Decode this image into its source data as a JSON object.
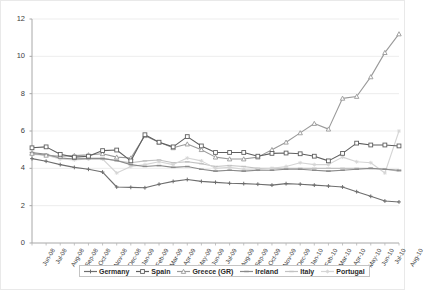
{
  "chart_data": {
    "type": "line",
    "title": "",
    "xlabel": "",
    "ylabel": "",
    "ylim": [
      0,
      12
    ],
    "yticks": [
      0,
      2,
      4,
      6,
      8,
      10,
      12
    ],
    "grid": true,
    "legend_position": "bottom",
    "categories": [
      "Jun-08",
      "Jul-08",
      "Aug-08",
      "Sep-08",
      "Oct-08",
      "Nov-08",
      "Dec-08",
      "Jan-09",
      "Feb-09",
      "Mar-09",
      "Apr-09",
      "May-09",
      "Jun-09",
      "Jul-09",
      "Aug-09",
      "Sep-09",
      "Oct-09",
      "Nov-09",
      "Dec-09",
      "Jan-10",
      "Feb-10",
      "Mar-10",
      "Apr-10",
      "May-10",
      "Jun-10",
      "Jul-10",
      "Aug-10"
    ],
    "series": [
      {
        "name": "Germany",
        "color": "#6e6e6e",
        "marker": "plus",
        "values": [
          4.52,
          4.38,
          4.2,
          4.05,
          3.95,
          3.8,
          3.0,
          2.98,
          2.96,
          3.15,
          3.3,
          3.4,
          3.3,
          3.25,
          3.2,
          3.18,
          3.15,
          3.1,
          3.18,
          3.15,
          3.1,
          3.05,
          3.0,
          2.75,
          2.5,
          2.25,
          2.2
        ]
      },
      {
        "name": "Spain",
        "color": "#5f5f5f",
        "marker": "square",
        "values": [
          5.1,
          5.15,
          4.75,
          4.6,
          4.65,
          4.95,
          4.98,
          4.4,
          5.8,
          5.4,
          5.15,
          5.7,
          5.2,
          4.85,
          4.85,
          4.85,
          4.65,
          4.8,
          4.82,
          4.78,
          4.65,
          4.4,
          4.8,
          5.35,
          5.25,
          5.25,
          5.2
        ]
      },
      {
        "name": "Greece (GR)",
        "color": "#9a9a9a",
        "marker": "triangle",
        "values": [
          4.8,
          4.7,
          4.65,
          4.68,
          4.72,
          4.78,
          4.6,
          4.55,
          5.75,
          5.4,
          5.1,
          5.3,
          5.0,
          4.6,
          4.5,
          4.5,
          4.6,
          5.0,
          5.4,
          5.9,
          6.4,
          6.1,
          7.75,
          7.85,
          8.9,
          10.2,
          11.2
        ]
      },
      {
        "name": "Ireland",
        "color": "#8a8a8a",
        "marker": "dash",
        "values": [
          4.85,
          4.75,
          4.55,
          4.5,
          4.52,
          4.52,
          4.42,
          4.2,
          4.1,
          4.15,
          4.05,
          4.1,
          3.95,
          3.85,
          3.9,
          3.85,
          3.9,
          3.9,
          3.95,
          3.95,
          3.9,
          3.85,
          3.9,
          3.95,
          4.0,
          3.95,
          3.9
        ]
      },
      {
        "name": "Italy",
        "color": "#c2c2c2",
        "marker": "dash",
        "values": [
          4.75,
          4.72,
          4.55,
          4.5,
          4.55,
          4.55,
          4.4,
          4.3,
          4.4,
          4.45,
          4.3,
          4.35,
          4.25,
          4.1,
          4.15,
          4.1,
          4.0,
          4.0,
          4.0,
          4.0,
          4.0,
          4.0,
          4.0,
          4.0,
          4.0,
          3.95,
          3.85
        ]
      },
      {
        "name": "Portugal",
        "color": "#d5d5d5",
        "marker": "star",
        "values": [
          4.78,
          4.7,
          4.5,
          4.45,
          4.5,
          4.5,
          3.75,
          4.1,
          4.2,
          4.35,
          4.2,
          4.55,
          4.4,
          4.0,
          4.05,
          3.95,
          3.95,
          4.0,
          4.1,
          4.3,
          4.2,
          4.2,
          4.6,
          4.35,
          4.3,
          3.75,
          6.0
        ]
      }
    ]
  },
  "axis": {
    "y_labels": [
      "12",
      "10",
      "8",
      "6",
      "4",
      "2",
      "0"
    ]
  },
  "legend": {
    "items": [
      {
        "label": "Germany"
      },
      {
        "label": "Spain"
      },
      {
        "label": "Greece (GR)"
      },
      {
        "label": "Ireland"
      },
      {
        "label": "Italy"
      },
      {
        "label": "Portugal"
      }
    ]
  }
}
